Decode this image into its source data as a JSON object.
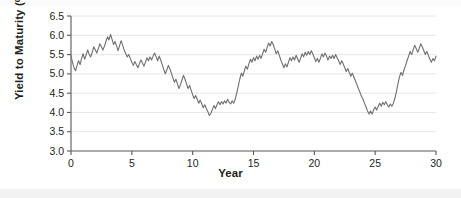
{
  "chart_data": {
    "type": "line",
    "title": "",
    "xlabel": "Year",
    "ylabel": "Yield to Maturity (%)",
    "xlim": [
      0,
      30
    ],
    "ylim": [
      3.0,
      6.5
    ],
    "xticks": [
      0,
      5,
      10,
      15,
      20,
      25,
      30
    ],
    "xtick_labels": [
      "0",
      "5",
      "10",
      "15",
      "20",
      "25",
      "30"
    ],
    "yticks": [
      3.0,
      3.5,
      4.0,
      4.5,
      5.0,
      5.5,
      6.0,
      6.5
    ],
    "ytick_labels": [
      "3.0",
      "3.5",
      "4.0",
      "4.5",
      "5.0",
      "5.5",
      "6.0",
      "6.5"
    ],
    "grid": "horizontal",
    "legend": "none",
    "series": [
      {
        "name": "Yield to Maturity",
        "color": "#6d6e71",
        "line_width": 1.1,
        "x": [
          0.0,
          0.12,
          0.25,
          0.37,
          0.5,
          0.62,
          0.75,
          0.87,
          1.0,
          1.12,
          1.25,
          1.37,
          1.5,
          1.62,
          1.75,
          1.87,
          2.0,
          2.12,
          2.25,
          2.37,
          2.5,
          2.62,
          2.75,
          2.87,
          3.0,
          3.12,
          3.25,
          3.37,
          3.5,
          3.62,
          3.75,
          3.87,
          4.0,
          4.12,
          4.25,
          4.37,
          4.5,
          4.62,
          4.75,
          4.87,
          5.0,
          5.12,
          5.25,
          5.37,
          5.5,
          5.62,
          5.75,
          5.87,
          6.0,
          6.12,
          6.25,
          6.37,
          6.5,
          6.62,
          6.75,
          6.87,
          7.0,
          7.12,
          7.25,
          7.37,
          7.5,
          7.62,
          7.75,
          7.87,
          8.0,
          8.12,
          8.25,
          8.37,
          8.5,
          8.62,
          8.75,
          8.87,
          9.0,
          9.12,
          9.25,
          9.37,
          9.5,
          9.62,
          9.75,
          9.87,
          10.0,
          10.12,
          10.25,
          10.37,
          10.5,
          10.62,
          10.75,
          10.87,
          11.0,
          11.12,
          11.25,
          11.37,
          11.5,
          11.62,
          11.75,
          11.87,
          12.0,
          12.12,
          12.25,
          12.37,
          12.5,
          12.62,
          12.75,
          12.87,
          13.0,
          13.12,
          13.25,
          13.37,
          13.5,
          13.62,
          13.75,
          13.87,
          14.0,
          14.12,
          14.25,
          14.37,
          14.5,
          14.62,
          14.75,
          14.87,
          15.0,
          15.12,
          15.25,
          15.37,
          15.5,
          15.62,
          15.75,
          15.87,
          16.0,
          16.12,
          16.25,
          16.37,
          16.5,
          16.62,
          16.75,
          16.87,
          17.0,
          17.12,
          17.25,
          17.37,
          17.5,
          17.62,
          17.75,
          17.87,
          18.0,
          18.12,
          18.25,
          18.37,
          18.5,
          18.62,
          18.75,
          18.87,
          19.0,
          19.12,
          19.25,
          19.37,
          19.5,
          19.62,
          19.75,
          19.87,
          20.0,
          20.12,
          20.25,
          20.37,
          20.5,
          20.62,
          20.75,
          20.87,
          21.0,
          21.12,
          21.25,
          21.37,
          21.5,
          21.62,
          21.75,
          21.87,
          22.0,
          22.12,
          22.25,
          22.37,
          22.5,
          22.62,
          22.75,
          22.87,
          23.0,
          23.12,
          23.25,
          23.37,
          23.5,
          23.62,
          23.75,
          23.87,
          24.0,
          24.12,
          24.25,
          24.37,
          24.5,
          24.62,
          24.75,
          24.87,
          25.0,
          25.12,
          25.25,
          25.37,
          25.5,
          25.62,
          25.75,
          25.87,
          26.0,
          26.12,
          26.25,
          26.37,
          26.5,
          26.62,
          26.75,
          26.87,
          27.0,
          27.12,
          27.25,
          27.37,
          27.5,
          27.62,
          27.75,
          27.87,
          28.0,
          28.12,
          28.25,
          28.37,
          28.5,
          28.62,
          28.75,
          28.87,
          29.0,
          29.12,
          29.25,
          29.37,
          29.5,
          29.62,
          29.75,
          29.87,
          30.0
        ],
        "y": [
          5.47,
          5.3,
          5.16,
          5.08,
          5.22,
          5.34,
          5.24,
          5.4,
          5.52,
          5.38,
          5.5,
          5.62,
          5.5,
          5.44,
          5.56,
          5.7,
          5.62,
          5.54,
          5.66,
          5.78,
          5.7,
          5.62,
          5.72,
          5.84,
          5.96,
          5.88,
          6.02,
          5.9,
          5.76,
          5.84,
          5.72,
          5.6,
          5.74,
          5.86,
          5.74,
          5.62,
          5.52,
          5.44,
          5.5,
          5.4,
          5.3,
          5.22,
          5.32,
          5.24,
          5.16,
          5.26,
          5.36,
          5.28,
          5.2,
          5.3,
          5.42,
          5.34,
          5.44,
          5.36,
          5.46,
          5.54,
          5.44,
          5.34,
          5.46,
          5.36,
          5.24,
          5.12,
          5.0,
          5.1,
          5.22,
          5.14,
          5.02,
          4.9,
          4.78,
          4.86,
          4.74,
          4.62,
          4.72,
          4.84,
          4.96,
          4.86,
          4.74,
          4.62,
          4.7,
          4.58,
          4.46,
          4.36,
          4.44,
          4.34,
          4.24,
          4.32,
          4.22,
          4.12,
          4.2,
          4.1,
          4.02,
          3.92,
          3.98,
          4.08,
          4.18,
          4.1,
          4.2,
          4.28,
          4.2,
          4.28,
          4.22,
          4.3,
          4.24,
          4.34,
          4.26,
          4.22,
          4.3,
          4.24,
          4.34,
          4.5,
          4.68,
          4.86,
          5.02,
          4.94,
          5.08,
          5.2,
          5.12,
          5.26,
          5.38,
          5.3,
          5.42,
          5.34,
          5.46,
          5.38,
          5.48,
          5.4,
          5.52,
          5.64,
          5.56,
          5.68,
          5.8,
          5.72,
          5.84,
          5.76,
          5.64,
          5.52,
          5.6,
          5.48,
          5.36,
          5.26,
          5.16,
          5.26,
          5.18,
          5.3,
          5.42,
          5.34,
          5.44,
          5.36,
          5.48,
          5.4,
          5.3,
          5.4,
          5.52,
          5.44,
          5.56,
          5.48,
          5.58,
          5.5,
          5.6,
          5.52,
          5.42,
          5.32,
          5.4,
          5.3,
          5.4,
          5.52,
          5.44,
          5.54,
          5.46,
          5.36,
          5.46,
          5.4,
          5.48,
          5.4,
          5.5,
          5.42,
          5.34,
          5.24,
          5.34,
          5.26,
          5.16,
          5.06,
          5.14,
          5.04,
          4.94,
          5.02,
          4.92,
          4.82,
          4.72,
          4.62,
          4.52,
          4.42,
          4.34,
          4.24,
          4.14,
          4.04,
          3.96,
          4.04,
          3.96,
          4.06,
          4.14,
          4.06,
          4.16,
          4.24,
          4.16,
          4.26,
          4.2,
          4.28,
          4.2,
          4.14,
          4.22,
          4.16,
          4.24,
          4.36,
          4.54,
          4.74,
          4.92,
          5.04,
          4.96,
          5.1,
          5.22,
          5.34,
          5.46,
          5.58,
          5.5,
          5.62,
          5.74,
          5.66,
          5.56,
          5.66,
          5.78,
          5.7,
          5.6,
          5.5,
          5.58,
          5.48,
          5.38,
          5.3,
          5.4,
          5.34,
          5.46
        ]
      }
    ]
  },
  "axes": {
    "ylabel_text": "Yield to Maturity (%)",
    "xlabel_text": "Year"
  }
}
